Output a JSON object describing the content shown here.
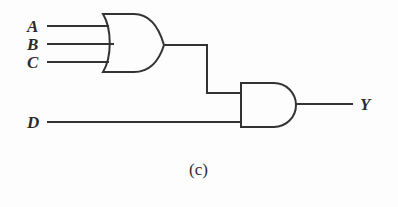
{
  "figure": {
    "caption": "(c)",
    "background_color": "#fdfdfd",
    "stroke_color": "#333333"
  },
  "inputs": [
    {
      "id": "A",
      "label": "A",
      "wire_y": 26,
      "gate": "or-gate"
    },
    {
      "id": "B",
      "label": "B",
      "wire_y": 44,
      "gate": "or-gate"
    },
    {
      "id": "C",
      "label": "C",
      "wire_y": 62,
      "gate": "or-gate"
    },
    {
      "id": "D",
      "label": "D",
      "wire_y": 122,
      "gate": "and-gate"
    }
  ],
  "outputs": [
    {
      "id": "Y",
      "label": "Y",
      "wire_y": 104,
      "gate": "and-gate"
    }
  ],
  "gates": [
    {
      "id": "or-gate",
      "type": "OR",
      "inputs": [
        "A",
        "B",
        "C"
      ],
      "output": "or-node",
      "x": 103,
      "y": 14,
      "width": 61,
      "height": 58
    },
    {
      "id": "and-gate",
      "type": "AND",
      "inputs": [
        "or-node",
        "D"
      ],
      "output": "Y",
      "x": 240,
      "y": 83,
      "width": 67,
      "height": 44
    }
  ],
  "nets": [
    {
      "id": "net-a",
      "from": "A",
      "to": "or-gate",
      "path": "48,26 to 107,26"
    },
    {
      "id": "net-b",
      "from": "B",
      "to": "or-gate",
      "path": "48,44 to 112,44"
    },
    {
      "id": "net-c",
      "from": "C",
      "to": "or-gate",
      "path": "48,62 to 107,62"
    },
    {
      "id": "net-or-and",
      "from": "or-gate",
      "to": "and-gate",
      "path": "164,45 to 207,45 to 207,93 to 240,93"
    },
    {
      "id": "net-d",
      "from": "D",
      "to": "and-gate",
      "path": "48,122 to 240,122"
    },
    {
      "id": "net-y",
      "from": "and-gate",
      "to": "Y",
      "path": "307,104 to 352,104"
    }
  ],
  "expression": "Y = (A + B + C) · D"
}
